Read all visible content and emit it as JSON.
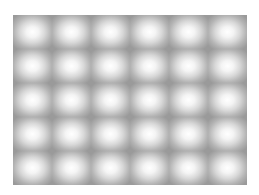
{
  "image": {
    "description": "Blurred grid of bright white spots on a gray background",
    "grid": {
      "rows": 5,
      "columns": 6
    },
    "colors": {
      "background": "#ffffff",
      "gap": "#9a9a9a",
      "spot_center": "#ffffff"
    }
  }
}
